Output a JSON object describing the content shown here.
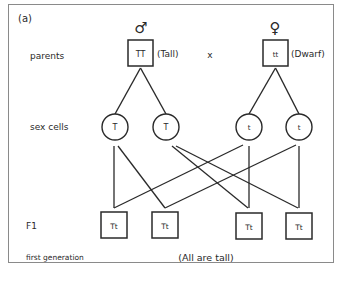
{
  "panel_label": "(a)",
  "symbols": {
    "male": "♂",
    "female": "♀"
  },
  "row_labels": {
    "parents": "parents",
    "sex_cells": "sex cells",
    "f1": "F1",
    "first_generation": "first generation"
  },
  "parents": {
    "male": {
      "genotype": "TT",
      "phenotype": "(Tall)"
    },
    "cross": "x",
    "female": {
      "genotype": "tt",
      "phenotype": "(Dwarf)"
    }
  },
  "gametes": [
    "T",
    "T",
    "t",
    "t"
  ],
  "offspring": [
    "Tt",
    "Tt",
    "Tt",
    "Tt"
  ],
  "note": "(All are tall)"
}
